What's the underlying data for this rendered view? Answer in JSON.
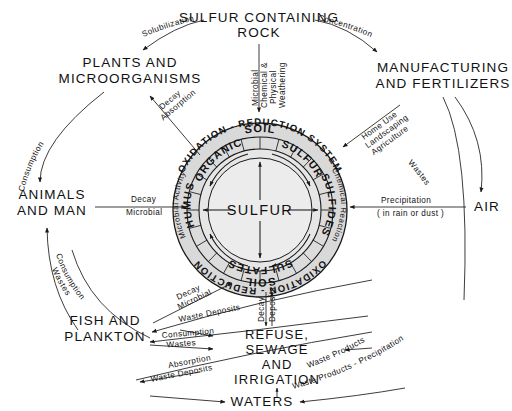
{
  "diagram": {
    "center_label": "SULFUR",
    "nodes": {
      "rock": "SULFUR CONTAINING\nROCK",
      "rock_l1": "SULFUR CONTAINING",
      "rock_l2": "ROCK",
      "plants_l1": "PLANTS AND",
      "plants_l2": "MICROORGANISMS",
      "manufacturing_l1": "MANUFACTURING",
      "manufacturing_l2": "AND FERTILIZERS",
      "animals_l1": "ANIMALS",
      "animals_l2": "AND MAN",
      "air": "AIR",
      "fish_l1": "FISH AND",
      "fish_l2": "PLANKTON",
      "refuse_l1": "REFUSE,",
      "refuse_l2": "SEWAGE",
      "refuse_l3": "AND",
      "refuse_l4": "IRRIGATION",
      "waters": "WATERS"
    },
    "ring": {
      "outer_top": "OXIDATION - REDUCTION SYSTEM",
      "outer_bottom": "OXIDATION - REDUCTION",
      "mid_top": "SOIL",
      "mid_bottom": "SOIL",
      "inner_top_left": "ORGANIC",
      "inner_top_right": "SULFUR",
      "inner_bottom": "SULFATES",
      "inner_left": "HUMUS",
      "inner_right": "SULFIDES",
      "band_left": "Microbial Activity",
      "band_right": "Chemical Reaction"
    },
    "edges": {
      "solubilization": "Solubilization",
      "concentration": "Concentration",
      "weathering_l1": "Microbial",
      "weathering_l2": "Chemical &",
      "weathering_l3": "Physical",
      "weathering_l4": "Weathering",
      "decay_absorption_l1": "Decay",
      "decay_absorption_l2": "Absorption",
      "consumption_top": "Consumption",
      "decay_microbial_l1": "Decay",
      "decay_microbial_l2": "Microbial",
      "consumption_wastes_l1": "Consumption",
      "consumption_wastes_l2": "Wastes",
      "home_use_l1": "Home Use",
      "home_use_l2": "Landscaping",
      "home_use_l3": "Agriculture",
      "wastes": "Wastes",
      "precipitation_l1": "Precipitation",
      "precipitation_l2": "( in rain or dust )",
      "decay_microbial2_l1": "Decay",
      "decay_microbial2_l2": "Microbial",
      "waste_deposits": "Waste Deposits",
      "consumption_wastes2_l1": "Consumption",
      "consumption_wastes2_l2": "Wastes",
      "absorption_deposits_l1": "Absorption",
      "absorption_deposits_l2": "Waste Deposits",
      "decay_vert": "Decay",
      "deposits_vert": "Deposits",
      "waste_products": "Waste Products",
      "waste_products_precip": "Waste Products - Precipitation"
    },
    "colors": {
      "stroke": "#1a1a1a",
      "ring_fill": "#d8d8d8",
      "core_fill": "#e9e9e9",
      "background": "#ffffff"
    }
  }
}
